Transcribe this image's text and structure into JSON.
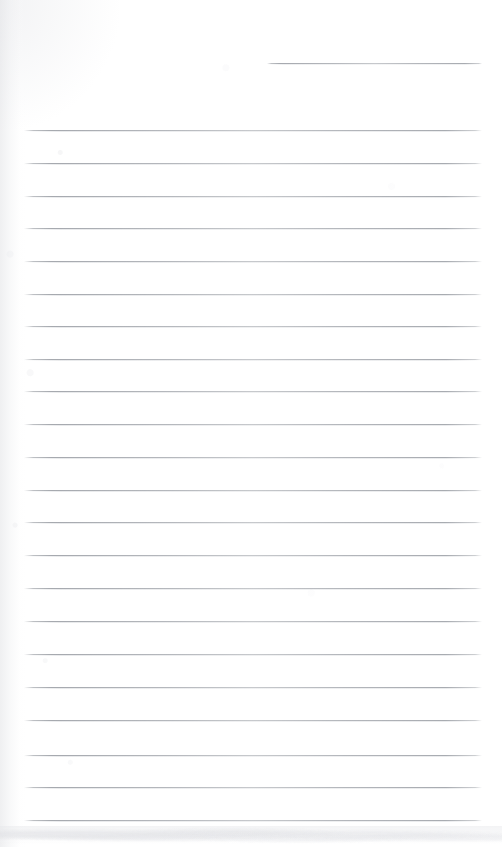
{
  "document": {
    "type": "scanned-lined-page",
    "title": "Blank ruled notebook page",
    "caption": "",
    "page_width": 502,
    "page_height": 847,
    "background_color": "#ffffff",
    "rule_color": "#9a9ea5",
    "rule_thickness_px": 1,
    "has_text": false,
    "text_content": ""
  },
  "layout": {
    "left_margin_x": 24,
    "right_margin_x": 482,
    "first_rule_y": 130,
    "last_rule_y": 820,
    "rule_spacing_px": 32.7,
    "full_rule_count": 22
  },
  "header_rule": {
    "name": "short-top-rule",
    "x": 267,
    "y": 63,
    "width": 215
  },
  "rules": [
    {
      "index": 1,
      "y": 130,
      "x": 24,
      "width": 458
    },
    {
      "index": 2,
      "y": 163,
      "x": 24,
      "width": 458
    },
    {
      "index": 3,
      "y": 196,
      "x": 24,
      "width": 458
    },
    {
      "index": 4,
      "y": 228,
      "x": 24,
      "width": 458
    },
    {
      "index": 5,
      "y": 261,
      "x": 24,
      "width": 458
    },
    {
      "index": 6,
      "y": 294,
      "x": 24,
      "width": 458
    },
    {
      "index": 7,
      "y": 326,
      "x": 24,
      "width": 458
    },
    {
      "index": 8,
      "y": 359,
      "x": 24,
      "width": 458
    },
    {
      "index": 9,
      "y": 391,
      "x": 24,
      "width": 458
    },
    {
      "index": 10,
      "y": 424,
      "x": 24,
      "width": 458
    },
    {
      "index": 11,
      "y": 457,
      "x": 24,
      "width": 458
    },
    {
      "index": 12,
      "y": 490,
      "x": 24,
      "width": 458
    },
    {
      "index": 13,
      "y": 522,
      "x": 24,
      "width": 458
    },
    {
      "index": 14,
      "y": 555,
      "x": 24,
      "width": 458
    },
    {
      "index": 15,
      "y": 588,
      "x": 24,
      "width": 458
    },
    {
      "index": 16,
      "y": 621,
      "x": 24,
      "width": 458
    },
    {
      "index": 17,
      "y": 654,
      "x": 24,
      "width": 458
    },
    {
      "index": 18,
      "y": 687,
      "x": 24,
      "width": 458
    },
    {
      "index": 19,
      "y": 720,
      "x": 24,
      "width": 458
    },
    {
      "index": 20,
      "y": 755,
      "x": 24,
      "width": 458
    },
    {
      "index": 21,
      "y": 787,
      "x": 24,
      "width": 458
    },
    {
      "index": 22,
      "y": 820,
      "x": 24,
      "width": 458
    }
  ],
  "artifacts": {
    "left_edge_shadow": true,
    "bottom_smudge_band": {
      "y": 826,
      "height": 21
    },
    "paper_grain": true
  }
}
